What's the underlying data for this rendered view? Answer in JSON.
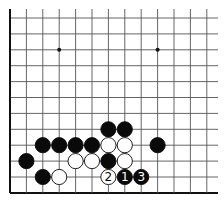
{
  "diagram": {
    "type": "go-board-diagram",
    "board": {
      "origin_x": 10,
      "origin_y": 18,
      "spacing_x": 16.4,
      "spacing_y": 15.9,
      "columns": 13,
      "rows": 12,
      "right_extent": 218,
      "top_extent": 9,
      "edges": {
        "left": true,
        "bottom": true,
        "top": false,
        "right": false
      },
      "line_color": "#555555",
      "edge_color": "#111111"
    },
    "star_points": [
      {
        "col": 3,
        "row": 2
      },
      {
        "col": 9,
        "row": 2
      }
    ],
    "stones": [
      {
        "color": "black",
        "col": 6,
        "row": 7
      },
      {
        "color": "black",
        "col": 7,
        "row": 7
      },
      {
        "color": "black",
        "col": 2,
        "row": 8
      },
      {
        "color": "black",
        "col": 3,
        "row": 8
      },
      {
        "color": "black",
        "col": 4,
        "row": 8
      },
      {
        "color": "black",
        "col": 5,
        "row": 8
      },
      {
        "color": "white",
        "col": 6,
        "row": 8
      },
      {
        "color": "white",
        "col": 7,
        "row": 8
      },
      {
        "color": "black",
        "col": 9,
        "row": 8
      },
      {
        "color": "black",
        "col": 1,
        "row": 9
      },
      {
        "color": "white",
        "col": 4,
        "row": 9
      },
      {
        "color": "white",
        "col": 5,
        "row": 9
      },
      {
        "color": "black",
        "col": 6,
        "row": 9
      },
      {
        "color": "white",
        "col": 7,
        "row": 9
      },
      {
        "color": "black",
        "col": 2,
        "row": 10
      },
      {
        "color": "white",
        "col": 3,
        "row": 10
      },
      {
        "color": "white",
        "col": 6,
        "row": 10,
        "label": "2"
      },
      {
        "color": "black",
        "col": 7,
        "row": 10,
        "label": "1"
      },
      {
        "color": "black",
        "col": 8,
        "row": 10,
        "label": "3"
      }
    ],
    "move_labels": [
      "1",
      "2",
      "3"
    ]
  }
}
